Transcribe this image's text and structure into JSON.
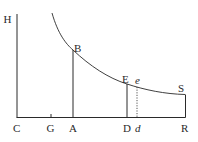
{
  "diagram": {
    "type": "geometric-figure",
    "colors": {
      "ink": "#2a2a2a",
      "background": "#ffffff"
    },
    "points": {
      "H": {
        "label": "H"
      },
      "C": {
        "label": "C"
      },
      "G": {
        "label": "G"
      },
      "A": {
        "label": "A"
      },
      "B": {
        "label": "B"
      },
      "D": {
        "label": "D"
      },
      "E": {
        "label": "E"
      },
      "d": {
        "label": "d"
      },
      "e": {
        "label": "e"
      },
      "R": {
        "label": "R"
      },
      "S": {
        "label": "S"
      }
    },
    "segments": [
      {
        "from": "C",
        "to": "H",
        "style": "solid",
        "role": "vertical axis"
      },
      {
        "from": "C",
        "to": "R",
        "style": "solid",
        "role": "horizontal axis"
      },
      {
        "from": "A",
        "to": "B",
        "style": "solid",
        "role": "ordinate"
      },
      {
        "from": "D",
        "to": "E",
        "style": "solid",
        "role": "ordinate"
      },
      {
        "from": "d",
        "to": "e",
        "style": "dotted",
        "role": "ordinate"
      },
      {
        "from": "R",
        "to": "S",
        "style": "solid",
        "role": "ordinate"
      }
    ],
    "curve": {
      "through": [
        "B",
        "E",
        "e",
        "S"
      ],
      "shape": "decreasing convex (hyperbolic)"
    },
    "ticks": [
      {
        "at": "G"
      }
    ]
  }
}
